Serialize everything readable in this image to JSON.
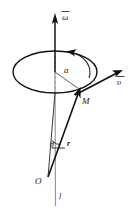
{
  "figure": {
    "background_color": "#ffffff",
    "line_color": "#111111",
    "axis_gray_color": "#9a9a9a",
    "labels": {
      "omega": "ω",
      "radius_a": "a",
      "velocity_v": "υ",
      "point_M": "M",
      "angle_theta": "θ",
      "position_r": "r",
      "origin_O": "O",
      "axis_l": "l"
    },
    "semantics": {
      "omega_description": "angular velocity vector along rotation axis",
      "a_description": "radius of the circular path",
      "v_description": "linear velocity vector tangent to circle at M",
      "M_description": "material point on the circular path",
      "theta_description": "angle between rotation axis and position vector",
      "r_description": "position vector from origin O to point M",
      "O_description": "origin on the rotation axis",
      "l_description": "rotation axis line"
    }
  },
  "geometry": {
    "axis_x": 55,
    "axis_top_y": 16,
    "axis_bottom_y": 205,
    "ellipse_center_x": 55,
    "ellipse_center_y": 72,
    "ellipse_rx": 42,
    "ellipse_ry": 21,
    "point_M_x": 79,
    "point_M_y": 90,
    "origin_O_x": 48,
    "origin_O_y": 178,
    "velocity_tip_x": 120,
    "velocity_tip_y": 71
  }
}
